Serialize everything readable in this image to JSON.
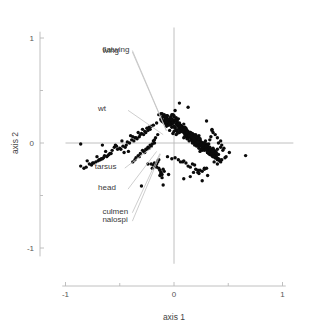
{
  "chart_data": {
    "type": "scatter",
    "title": "",
    "subtitle": "",
    "xlabel": "axis 1",
    "ylabel": "axis 2",
    "xlim": [
      -1.0,
      1.1
    ],
    "ylim": [
      -1.15,
      1.1
    ],
    "xticks": [
      -1,
      0,
      1
    ],
    "xticklabels": [
      "-1",
      "0",
      "1"
    ],
    "yticks": [
      -1,
      0,
      1
    ],
    "yticklabels": [
      "-1",
      "0",
      "1"
    ],
    "minor_xticks": [
      -0.5,
      0.5
    ],
    "minor_yticks": [
      -0.5,
      0.5
    ],
    "grid": false,
    "legend": "none",
    "point_color": "#0b0b0b",
    "point_radius": 1.7,
    "loading_line_color": "#c2c2c2",
    "axis_color": "#b9b9b9",
    "annotations": [
      {
        "label": "flatwing",
        "label_x": -0.66,
        "label_y": 0.9,
        "tip_x": -0.07,
        "tip_y": 0.12
      },
      {
        "label": "wing",
        "label_x": -0.66,
        "label_y": 0.885,
        "tip_x": -0.07,
        "tip_y": 0.115
      },
      {
        "label": "wt",
        "label_x": -0.7,
        "label_y": 0.33,
        "tip_x": -0.1,
        "tip_y": 0.08
      },
      {
        "label": "tarsus",
        "label_x": -0.73,
        "label_y": -0.22,
        "tip_x": -0.2,
        "tip_y": -0.04
      },
      {
        "label": "head",
        "label_x": -0.7,
        "label_y": -0.42,
        "tip_x": -0.16,
        "tip_y": -0.08
      },
      {
        "label": "culmen",
        "label_x": -0.66,
        "label_y": -0.645,
        "tip_x": -0.13,
        "tip_y": -0.1
      },
      {
        "label": "nalospi",
        "label_x": -0.66,
        "label_y": -0.725,
        "tip_x": -0.125,
        "tip_y": -0.105
      }
    ],
    "series": [
      {
        "name": "samples",
        "n_points": 620,
        "x": [
          -0.04,
          0.02,
          0.09,
          0.14,
          -0.02,
          0.05,
          0.11,
          0.18,
          0.21,
          0.07,
          -0.08,
          0.03,
          0.16,
          0.23,
          0.12,
          0.01,
          -0.05,
          0.08,
          0.19,
          0.26,
          0.04,
          -0.01,
          0.13,
          0.22,
          0.31,
          0.06,
          -0.11,
          0.1,
          0.17,
          0.28,
          0.0,
          -0.06,
          0.15,
          0.24,
          0.33,
          0.02,
          -0.09,
          0.12,
          0.2,
          0.29,
          0.05,
          -0.03,
          0.18,
          0.27,
          0.36,
          0.08,
          -0.13,
          0.14,
          0.25,
          0.34,
          0.03,
          -0.07,
          0.16,
          0.23,
          0.32,
          0.09,
          -0.02,
          0.21,
          0.3,
          0.38,
          0.06,
          -0.1,
          0.13,
          0.19,
          0.27,
          0.01,
          -0.04,
          0.17,
          0.26,
          0.35,
          0.11,
          -0.08,
          0.22,
          0.31,
          0.4,
          0.04,
          -0.12,
          0.15,
          0.24,
          0.33,
          0.07,
          -0.01,
          0.2,
          0.29,
          0.37,
          0.02,
          -0.06,
          0.18,
          0.28,
          0.36,
          0.1,
          -0.03,
          0.23,
          0.32,
          0.41,
          0.05,
          -0.09,
          0.14,
          0.21,
          0.3,
          0.0,
          -0.05,
          0.19,
          0.27,
          0.34,
          0.08,
          -0.14,
          0.16,
          0.25,
          0.35,
          0.03,
          -0.02,
          0.22,
          0.31,
          0.39,
          0.12,
          -0.07,
          0.17,
          0.26,
          0.33,
          0.06,
          -0.11,
          0.2,
          0.29,
          0.38,
          0.01,
          -0.04,
          0.15,
          0.23,
          0.32,
          0.09,
          -0.08,
          0.24,
          0.33,
          0.42,
          0.04,
          -0.01,
          0.18,
          0.27,
          0.36,
          0.11,
          -0.06,
          0.21,
          0.3,
          0.4,
          0.02,
          -0.1,
          0.16,
          0.25,
          0.34,
          0.07,
          -0.03,
          0.19,
          0.28,
          0.37,
          0.13,
          -0.09,
          0.22,
          0.31,
          0.43,
          0.05,
          -0.05,
          0.17,
          0.24,
          0.35,
          0.0,
          -0.12,
          0.2,
          0.29,
          0.38,
          0.1,
          -0.02,
          0.23,
          0.32,
          0.41,
          0.06,
          -0.07,
          0.15,
          0.26,
          0.33,
          0.03,
          -0.04,
          0.21,
          0.3,
          0.39,
          0.08,
          -0.11,
          0.18,
          0.27,
          0.36,
          0.12,
          -0.01,
          0.24,
          0.34,
          0.44,
          0.01,
          -0.06,
          0.16,
          0.22,
          0.31,
          0.09,
          -0.08,
          0.2,
          0.28,
          0.37,
          0.04,
          -0.03,
          0.19,
          0.29,
          0.4,
          -0.55,
          -0.63,
          -0.71,
          -0.48,
          -0.8,
          -0.38,
          -0.59,
          -0.44,
          -0.67,
          -0.33,
          -0.52,
          -0.75,
          -0.41,
          -0.86,
          -0.29,
          -0.61,
          -0.47,
          -0.36,
          -0.69,
          -0.25,
          -0.57,
          -0.43,
          -0.78,
          -0.31,
          -0.65,
          -0.5,
          -0.39,
          -0.72,
          -0.27,
          -0.83,
          -0.46,
          -0.34,
          -0.6,
          -0.23,
          -0.54,
          -0.4,
          -0.68,
          -0.3,
          -0.76,
          -0.21,
          -0.49,
          -0.37,
          -0.62,
          -0.26,
          -0.7,
          -0.45,
          -0.32,
          -0.58,
          -0.24,
          -0.81,
          -0.42,
          -0.28,
          -0.66,
          -0.19,
          -0.53,
          -0.35,
          -0.74,
          -0.22,
          -0.64,
          -0.18,
          -0.16,
          -0.2,
          -0.15,
          -0.17,
          -0.13,
          -0.14,
          -0.12,
          -0.19,
          -0.11,
          -0.18,
          -0.1,
          -0.16,
          -0.09,
          -0.15,
          -0.13,
          -0.21,
          -0.12,
          -0.14,
          -0.11,
          -0.17,
          0.46,
          0.51,
          0.43,
          0.48,
          0.4,
          0.44,
          0.38,
          0.42,
          0.36,
          0.45,
          0.39,
          0.41,
          0.37,
          0.35,
          0.43,
          0.47,
          0.34,
          0.4,
          0.33,
          0.38,
          0.66,
          -0.3,
          0.26,
          0.01,
          -0.1,
          -0.86,
          -0.02,
          0.13,
          0.3,
          -0.05,
          0.22,
          -0.66,
          0.09,
          0.35,
          -0.16,
          0.18,
          0.05,
          -0.24,
          0.28,
          0.15,
          -0.01,
          0.06,
          0.12,
          0.19,
          0.24,
          -0.07,
          0.03,
          0.1,
          0.17,
          0.25,
          0.08,
          -0.04,
          0.14,
          0.21,
          0.29,
          0.02,
          -0.09,
          0.16,
          0.23,
          0.31,
          0.05,
          -0.02,
          0.11,
          0.18,
          0.27,
          0.09,
          -0.06,
          0.13,
          0.2,
          0.28,
          0.04,
          -0.11,
          0.15,
          0.22,
          0.3,
          0.07,
          -0.03,
          0.19,
          0.26,
          0.34,
          0.0,
          -0.08,
          0.12,
          0.21,
          0.32,
          0.06,
          -0.05,
          0.17,
          0.24,
          0.33,
          0.1,
          -0.01,
          0.2,
          0.27,
          0.35,
          0.03,
          -0.07,
          0.14,
          0.23,
          0.31,
          0.08,
          -0.04,
          0.18,
          0.25,
          0.36,
          0.01,
          -0.1,
          0.13,
          0.22,
          0.29,
          0.11,
          -0.02,
          0.21,
          0.3,
          0.38,
          0.05,
          -0.06,
          0.16,
          0.24,
          0.32,
          0.02,
          -0.09,
          0.19,
          0.28,
          0.37,
          0.07,
          -0.03,
          0.15,
          0.26,
          0.34,
          0.12,
          -0.05,
          0.23,
          0.31,
          0.39,
          0.04,
          -0.08,
          0.17,
          0.25,
          0.33,
          0.09,
          -0.01,
          0.2,
          0.29,
          0.36,
          0.06,
          -0.12,
          0.14,
          0.22,
          0.3,
          0.0,
          -0.04,
          0.18,
          0.27,
          0.35,
          0.1,
          -0.07,
          0.21,
          0.28,
          0.4,
          -0.26,
          -0.31,
          -0.22,
          -0.35,
          -0.19,
          -0.28,
          -0.24,
          -0.33,
          -0.17,
          -0.29,
          -0.21,
          -0.36,
          -0.15,
          -0.27,
          -0.23,
          -0.38,
          -0.18,
          -0.25,
          -0.2,
          -0.32,
          0.13,
          0.06,
          0.24,
          -0.02,
          0.3,
          0.17,
          0.09,
          0.22,
          -0.06,
          0.28,
          0.04,
          0.19,
          0.11,
          0.26,
          0.01,
          0.15,
          0.23,
          0.08,
          0.31,
          0.2
        ],
        "y": [
          0.12,
          0.08,
          0.05,
          0.02,
          0.15,
          0.1,
          0.06,
          0.01,
          -0.03,
          0.13,
          0.18,
          0.09,
          0.03,
          -0.05,
          0.07,
          0.14,
          0.17,
          0.11,
          0.0,
          -0.07,
          0.16,
          0.19,
          0.04,
          -0.02,
          -0.09,
          0.12,
          0.21,
          0.08,
          0.02,
          -0.06,
          0.2,
          0.23,
          0.06,
          -0.01,
          -0.11,
          0.18,
          0.25,
          0.1,
          0.03,
          -0.04,
          0.15,
          0.22,
          0.07,
          -0.02,
          -0.13,
          0.13,
          0.27,
          0.09,
          0.01,
          -0.08,
          0.19,
          0.24,
          0.05,
          -0.03,
          -0.1,
          0.11,
          0.21,
          0.02,
          -0.06,
          -0.14,
          0.16,
          0.26,
          0.08,
          0.04,
          -0.05,
          0.22,
          0.18,
          0.06,
          -0.01,
          -0.12,
          0.1,
          0.23,
          0.03,
          -0.04,
          -0.16,
          0.17,
          0.28,
          0.07,
          0.0,
          -0.09,
          0.14,
          0.2,
          0.05,
          -0.02,
          -0.11,
          0.24,
          0.19,
          0.08,
          -0.03,
          -0.13,
          0.12,
          0.25,
          0.04,
          -0.05,
          -0.15,
          0.18,
          0.21,
          0.09,
          0.02,
          -0.07,
          0.26,
          0.22,
          0.06,
          -0.01,
          -0.1,
          0.15,
          0.27,
          0.08,
          0.0,
          -0.12,
          0.2,
          0.23,
          0.03,
          -0.04,
          -0.14,
          0.11,
          0.24,
          0.07,
          -0.02,
          -0.08,
          0.17,
          0.28,
          0.05,
          -0.03,
          -0.13,
          0.21,
          0.19,
          0.1,
          0.01,
          -0.09,
          0.13,
          0.25,
          0.04,
          -0.06,
          -0.17,
          0.18,
          0.22,
          0.07,
          -0.01,
          -0.11,
          0.14,
          0.26,
          0.03,
          -0.05,
          -0.15,
          0.23,
          0.2,
          0.08,
          0.0,
          -0.1,
          0.16,
          0.24,
          0.06,
          -0.02,
          -0.12,
          0.11,
          0.27,
          0.05,
          -0.04,
          -0.18,
          0.19,
          0.21,
          0.09,
          0.02,
          -0.08,
          0.25,
          0.23,
          0.04,
          -0.03,
          -0.14,
          0.13,
          0.18,
          0.07,
          -0.01,
          -0.11,
          0.17,
          0.26,
          0.1,
          -0.05,
          -0.09,
          0.22,
          0.2,
          0.06,
          -0.02,
          -0.13,
          0.15,
          0.24,
          0.08,
          0.0,
          -0.1,
          0.12,
          0.27,
          0.03,
          -0.06,
          -0.16,
          0.21,
          0.19,
          0.09,
          0.04,
          -0.07,
          0.18,
          0.25,
          0.05,
          -0.01,
          -0.12,
          0.23,
          0.22,
          0.07,
          -0.04,
          -0.15,
          -0.04,
          -0.08,
          -0.13,
          0.02,
          -0.17,
          0.06,
          -0.1,
          -0.02,
          -0.15,
          0.1,
          -0.06,
          -0.19,
          0.0,
          -0.22,
          0.13,
          -0.12,
          -0.03,
          0.05,
          -0.16,
          0.14,
          -0.07,
          0.01,
          -0.2,
          0.08,
          -0.14,
          -0.05,
          0.03,
          -0.18,
          0.11,
          -0.24,
          -0.09,
          0.04,
          -0.11,
          0.15,
          -0.02,
          0.07,
          -0.16,
          0.09,
          -0.21,
          0.16,
          -0.06,
          0.02,
          -0.13,
          0.1,
          -0.17,
          -0.04,
          0.06,
          -0.1,
          0.12,
          -0.23,
          -0.08,
          0.08,
          -0.15,
          0.17,
          -0.03,
          0.05,
          -0.19,
          0.13,
          -0.12,
          0.0,
          -0.2,
          -0.24,
          -0.18,
          -0.22,
          -0.26,
          -0.16,
          -0.28,
          -0.21,
          -0.3,
          -0.19,
          -0.25,
          -0.23,
          -0.27,
          -0.17,
          -0.31,
          -0.2,
          -0.29,
          -0.24,
          -0.33,
          -0.22,
          -0.05,
          -0.09,
          0.02,
          -0.13,
          0.05,
          -0.02,
          0.08,
          -0.16,
          0.1,
          -0.07,
          -0.11,
          0.0,
          -0.18,
          0.12,
          -0.04,
          -0.14,
          0.06,
          -0.2,
          0.03,
          -0.08,
          -0.12,
          -0.41,
          -0.36,
          0.31,
          -0.4,
          -0.01,
          0.27,
          0.34,
          0.21,
          -0.3,
          -0.26,
          -0.02,
          -0.34,
          0.13,
          0.19,
          -0.28,
          0.38,
          -0.2,
          -0.24,
          -0.32,
          0.09,
          0.13,
          0.04,
          -0.02,
          -0.08,
          0.16,
          0.11,
          0.06,
          0.0,
          -0.06,
          0.14,
          0.18,
          0.07,
          0.01,
          -0.05,
          0.12,
          0.2,
          0.03,
          -0.03,
          -0.09,
          0.15,
          0.19,
          0.08,
          0.02,
          -0.04,
          0.1,
          0.17,
          0.05,
          -0.01,
          -0.07,
          0.13,
          0.21,
          0.06,
          0.0,
          -0.06,
          0.11,
          0.18,
          0.04,
          -0.02,
          -0.1,
          0.16,
          0.22,
          0.07,
          0.01,
          -0.05,
          0.12,
          0.19,
          0.03,
          -0.03,
          -0.08,
          0.14,
          0.2,
          0.05,
          -0.01,
          -0.07,
          0.17,
          0.23,
          0.06,
          0.0,
          -0.09,
          0.11,
          0.18,
          0.04,
          -0.02,
          -0.06,
          0.15,
          0.21,
          0.08,
          0.02,
          -0.04,
          0.13,
          0.19,
          0.05,
          -0.01,
          -0.08,
          0.16,
          0.22,
          0.07,
          0.01,
          -0.05,
          0.12,
          0.2,
          0.03,
          -0.03,
          -0.07,
          0.14,
          0.17,
          0.06,
          0.0,
          -0.06,
          0.1,
          0.23,
          0.04,
          -0.02,
          -0.09,
          0.18,
          0.21,
          0.05,
          -0.01,
          -0.04,
          0.13,
          0.19,
          0.08,
          0.02,
          -0.05,
          0.16,
          0.22,
          0.07,
          0.01,
          -0.03,
          0.11,
          0.18,
          0.04,
          -0.02,
          -0.08,
          0.15,
          0.2,
          0.06,
          0.0,
          -0.06,
          -0.06,
          -0.1,
          -0.02,
          -0.14,
          0.02,
          -0.08,
          -0.04,
          -0.12,
          0.05,
          -0.07,
          -0.03,
          -0.16,
          0.08,
          -0.09,
          -0.05,
          -0.18,
          0.03,
          -0.06,
          -0.01,
          -0.13,
          -0.22,
          -0.18,
          -0.26,
          -0.15,
          -0.24,
          -0.2,
          -0.17,
          -0.28,
          -0.13,
          -0.25,
          -0.16,
          -0.21,
          -0.19,
          -0.27,
          -0.14,
          -0.23,
          -0.29,
          -0.18,
          -0.31,
          -0.25
        ]
      }
    ]
  }
}
